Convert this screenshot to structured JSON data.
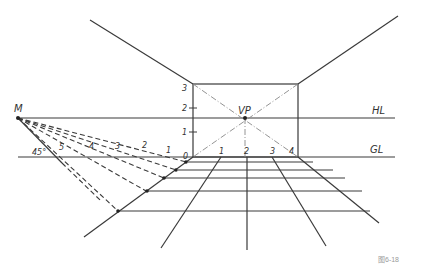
{
  "figure": {
    "caption": "图6-18",
    "colors": {
      "line": "#3a3a3a",
      "dash": "#3a3a3a",
      "light": "#888888",
      "caption": "#9a9a9a"
    }
  },
  "labels": {
    "vp": "VP",
    "hl": "HL",
    "gl": "GL",
    "m": "M",
    "angle": "45°",
    "vertical_scale": [
      "0",
      "1",
      "2",
      "3"
    ],
    "ground_scale": [
      "1",
      "2",
      "3",
      "4"
    ],
    "measure_scale": [
      "1",
      "2",
      "3",
      "4",
      "5"
    ]
  },
  "geometry": {
    "vp": [
      245,
      118
    ],
    "m": [
      18,
      118
    ],
    "hl_y": 118,
    "gl_y": 157,
    "back_wall": {
      "left": 193,
      "right": 298,
      "top": 84,
      "bottom": 157
    }
  }
}
